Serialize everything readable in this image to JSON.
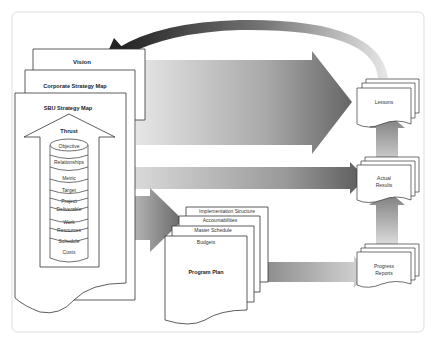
{
  "diagram": {
    "strategy_stack": {
      "vision": "Vision",
      "corporate_strategy_map": "Corporate Strategy Map",
      "sbu_strategy_map": "SBU Strategy Map",
      "thrust": "Thrust",
      "cylinder_items": [
        "Objective",
        "Relationships",
        "Metric",
        "Target",
        "Project",
        "Deliverable",
        "Work",
        "Resources",
        "Schedule",
        "Costs"
      ]
    },
    "program_stack": {
      "implementation_structure": "Implementation Structure",
      "accountabilities": "Accountabilities",
      "master_schedule": "Master Schedule",
      "budgets": "Budgets",
      "program_plan": "Program Plan"
    },
    "outputs": {
      "lessons": "Lessons",
      "actual_results_1": "Actual",
      "actual_results_2": "Results",
      "progress_reports_1": "Progress",
      "progress_reports_2": "Reports"
    },
    "colors": {
      "frame_border": "#dddddd",
      "doc_stroke": "#333333",
      "arrow_dark": "#555555",
      "arrow_light": "#dddddd",
      "feedback_dark": "#2a2a2a"
    }
  }
}
